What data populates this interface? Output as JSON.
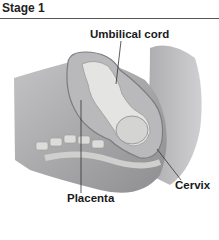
{
  "title": "Stage 1",
  "labels": {
    "umbilical_cord": "Umbilical cord",
    "placenta": "Placenta",
    "cervix": "Cervix"
  },
  "colors": {
    "body_fill": "#9a9a9c",
    "body_light": "#c8c8ca",
    "uterus_fill": "#b3b3b5",
    "fetus_fill": "#e2e2e0",
    "spine_fill": "#d8d8d6",
    "line": "#333333"
  }
}
